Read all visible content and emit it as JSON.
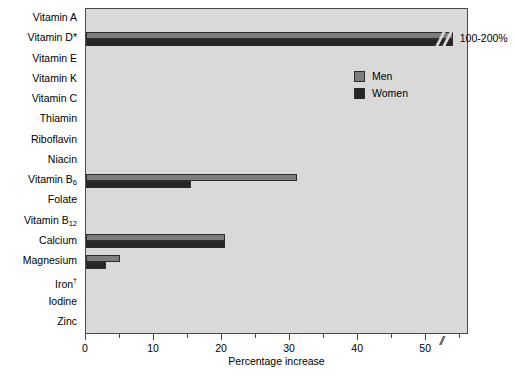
{
  "chart_data": {
    "type": "bar",
    "orientation": "horizontal",
    "title": "",
    "xlabel": "Percentage increase",
    "ylabel": "",
    "xlim": [
      0,
      56
    ],
    "xticks_major": [
      0,
      10,
      20,
      30,
      40,
      50
    ],
    "xticks_minor": [
      5,
      15,
      25,
      35,
      45,
      55
    ],
    "grid": false,
    "axis_break": {
      "present": true,
      "after_value": 52,
      "label": "100-200%",
      "symbol": "//"
    },
    "legend": {
      "position": "upper-right-inside",
      "entries": [
        {
          "name": "Men",
          "color": "#7d7d7d"
        },
        {
          "name": "Women",
          "color": "#262626"
        }
      ]
    },
    "categories": [
      "Vitamin A",
      "Vitamin D*",
      "Vitamin E",
      "Vitamin K",
      "Vitamin C",
      "Thiamin",
      "Riboflavin",
      "Niacin",
      "Vitamin B6",
      "Folate",
      "Vitamin B12",
      "Calcium",
      "Magnesium",
      "Iron†",
      "Iodine",
      "Zinc"
    ],
    "series": [
      {
        "name": "Men",
        "color": "#7d7d7d",
        "values": [
          0,
          54,
          0,
          0,
          0,
          0,
          0,
          0,
          31.0,
          0,
          0,
          20.5,
          5.0,
          0,
          0,
          0
        ]
      },
      {
        "name": "Women",
        "color": "#262626",
        "values": [
          0,
          54,
          0,
          0,
          0,
          0,
          0,
          0,
          15.5,
          0,
          0,
          20.5,
          3.0,
          0,
          0,
          0
        ]
      }
    ],
    "notes": [
      "* Vitamin D values exceed the axis; actual increase is 100-200%",
      "† Iron"
    ]
  },
  "axis": {
    "x_title": "Percentage increase",
    "tick_labels": [
      "0",
      "10",
      "20",
      "30",
      "40",
      "50"
    ],
    "break_symbol": "//"
  },
  "annotations": {
    "vitamin_d_label": "100-200%"
  },
  "legend": {
    "men_label": "Men",
    "women_label": "Women"
  },
  "colors": {
    "plot_background": "#d9d9d9",
    "men": "#7d7d7d",
    "women": "#262626",
    "frame": "#4a4a4a"
  },
  "caption": ""
}
